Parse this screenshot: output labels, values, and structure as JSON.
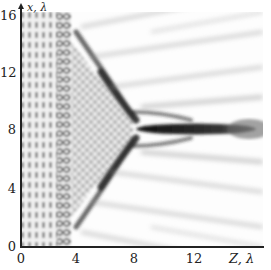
{
  "figure": {
    "type": "intensity-map",
    "x_axis": {
      "label": "Z, λ",
      "ticks": [
        "0",
        "4",
        "8",
        "12"
      ],
      "range": [
        0,
        17
      ]
    },
    "y_axis": {
      "label": "x, λ",
      "ticks": [
        "0",
        "4",
        "8",
        "12",
        "16"
      ],
      "range": [
        0,
        16
      ]
    },
    "colors": {
      "background": "#ffffff",
      "axis": "#222222",
      "dark": "#1a1a1a"
    }
  }
}
